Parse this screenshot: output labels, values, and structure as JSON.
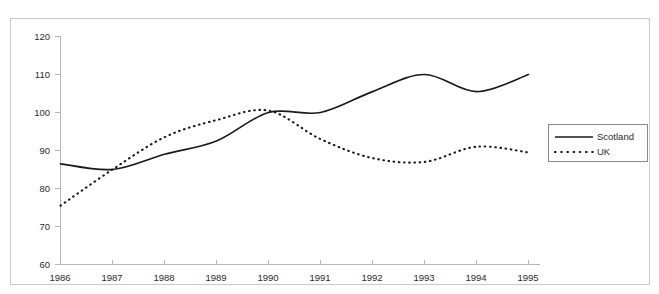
{
  "chart_data": {
    "type": "line",
    "title": "",
    "xlabel": "",
    "ylabel": "",
    "x": [
      1986,
      1987,
      1988,
      1989,
      1990,
      1991,
      1992,
      1993,
      1994,
      1995
    ],
    "categories": [
      "1986",
      "1987",
      "1988",
      "1989",
      "1990",
      "1991",
      "1992",
      "1993",
      "1994",
      "1995"
    ],
    "series": [
      {
        "name": "Scotland",
        "style": "solid",
        "color": "#1a1a1a",
        "values": [
          86.5,
          85.0,
          89.0,
          92.5,
          100.0,
          100.0,
          105.5,
          110.0,
          105.5,
          110.0
        ]
      },
      {
        "name": "UK",
        "style": "dotted",
        "color": "#1a1a1a",
        "values": [
          75.5,
          85.0,
          93.5,
          98.0,
          100.5,
          93.0,
          88.0,
          87.0,
          91.0,
          89.5
        ]
      }
    ],
    "xlim": [
      1986,
      1995
    ],
    "ylim": [
      60,
      120
    ],
    "yticks": [
      60,
      70,
      80,
      90,
      100,
      110,
      120
    ],
    "ytick_labels": [
      "60",
      "70",
      "80",
      "90",
      "100",
      "110",
      "120"
    ],
    "xticks": [
      1986,
      1987,
      1988,
      1989,
      1990,
      1991,
      1992,
      1993,
      1994,
      1995
    ],
    "xtick_labels": [
      "1986",
      "1987",
      "1988",
      "1989",
      "1990",
      "1991",
      "1992",
      "1993",
      "1994",
      "1995"
    ],
    "grid": false,
    "legend_position": "right"
  },
  "legend": {
    "entries": [
      {
        "label": "Scotland",
        "style": "solid"
      },
      {
        "label": "UK",
        "style": "dotted"
      }
    ]
  },
  "axes": {
    "y_labels": [
      "120",
      "110",
      "100",
      "90",
      "80",
      "70",
      "60"
    ],
    "x_labels": [
      "1986",
      "1987",
      "1988",
      "1989",
      "1990",
      "1991",
      "1992",
      "1993",
      "1994",
      "1995"
    ]
  },
  "colors": {
    "line": "#1a1a1a",
    "axis": "#b5b5b5",
    "frame": "#c9c9c9",
    "text": "#2b2b2b",
    "background": "#ffffff"
  }
}
